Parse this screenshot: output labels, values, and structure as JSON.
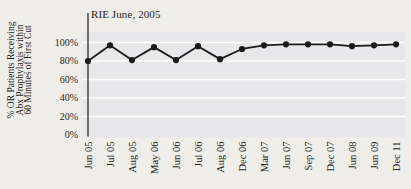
{
  "figure": {
    "annotation": "RIE June, 2005",
    "colors": {
      "page_bg": "#f0eee9",
      "plot_bg": "#e8e8ea",
      "grid": "#ffffff",
      "line": "#1b1b1b",
      "marker": "#1b1b1b",
      "text": "#1f1f1f"
    }
  },
  "chart_data": {
    "type": "line",
    "title": "",
    "annotation": "RIE June, 2005",
    "categories": [
      "Jun 05",
      "Jul 05",
      "Aug 05",
      "May 06",
      "Jun 06",
      "Jul 06",
      "Aug 06",
      "Dec 06",
      "Mar 07",
      "Jun 07",
      "Sep 07",
      "Dec 07",
      "Jun 08",
      "Jun 09",
      "Dec 11"
    ],
    "series": [
      {
        "name": "% OR patients receiving Abx prophylaxis within 60 minutes of first cut",
        "values": [
          80,
          97,
          81,
          95,
          81,
          96,
          82,
          93,
          97,
          98,
          98,
          98,
          96,
          97,
          98
        ]
      }
    ],
    "xlabel": "",
    "ylabel": "% OR Patients Receiving Abx Prophylaxis within 60 Minutes of First Cut",
    "ylabel_lines": [
      "% OR Patients Receiving",
      "Abx Prophylaxis within",
      "60 Minutes of First Cut"
    ],
    "yticks": [
      0,
      20,
      40,
      60,
      80,
      100
    ],
    "ytick_labels": [
      "0%",
      "20%",
      "40%",
      "60%",
      "80%",
      "100%"
    ],
    "ylim": [
      0,
      112
    ],
    "grid": "horizontal-white-lines",
    "legend": "none",
    "marker": "filled-circle",
    "vline": {
      "at_category": "Jun 05",
      "label": "RIE June, 2005"
    }
  }
}
